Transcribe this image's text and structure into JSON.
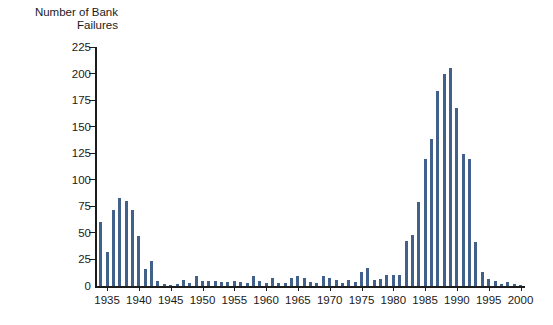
{
  "title": {
    "line1": "Number of Bank",
    "line2": "Failures"
  },
  "colors": {
    "bar": "#41608a",
    "axis": "#1c1c1c",
    "text": "#1a1a1a",
    "background": "#ffffff"
  },
  "chart_data": {
    "type": "bar",
    "title": "Number of Bank Failures",
    "xlabel": "",
    "ylabel": "Number of Bank Failures",
    "ylim": [
      0,
      225
    ],
    "ytick_interval": 25,
    "y_ticks": [
      0,
      25,
      50,
      75,
      100,
      125,
      150,
      175,
      200,
      225
    ],
    "xtick_years": [
      1935,
      1940,
      1945,
      1950,
      1955,
      1960,
      1965,
      1970,
      1975,
      1980,
      1985,
      1990,
      1995,
      2000
    ],
    "grid": "off",
    "legend": "none",
    "x": [
      1934,
      1935,
      1936,
      1937,
      1938,
      1939,
      1940,
      1941,
      1942,
      1943,
      1944,
      1945,
      1946,
      1947,
      1948,
      1949,
      1950,
      1951,
      1952,
      1953,
      1954,
      1955,
      1956,
      1957,
      1958,
      1959,
      1960,
      1961,
      1962,
      1963,
      1964,
      1965,
      1966,
      1967,
      1968,
      1969,
      1970,
      1971,
      1972,
      1973,
      1974,
      1975,
      1976,
      1977,
      1978,
      1979,
      1980,
      1981,
      1982,
      1983,
      1984,
      1985,
      1986,
      1987,
      1988,
      1989,
      1990,
      1991,
      1992,
      1993,
      1994,
      1995,
      1996,
      1997,
      1998,
      1999,
      2000
    ],
    "values": [
      60,
      32,
      72,
      83,
      80,
      72,
      47,
      16,
      24,
      5,
      2,
      1,
      2,
      6,
      3,
      9,
      5,
      5,
      5,
      4,
      4,
      5,
      4,
      3,
      9,
      5,
      3,
      8,
      3,
      3,
      8,
      9,
      8,
      4,
      3,
      9,
      8,
      6,
      3,
      6,
      4,
      13,
      17,
      6,
      7,
      10,
      10,
      10,
      42,
      48,
      79,
      120,
      138,
      184,
      200,
      205,
      168,
      124,
      120,
      41,
      13,
      7,
      5,
      2,
      4,
      2,
      1
    ]
  }
}
